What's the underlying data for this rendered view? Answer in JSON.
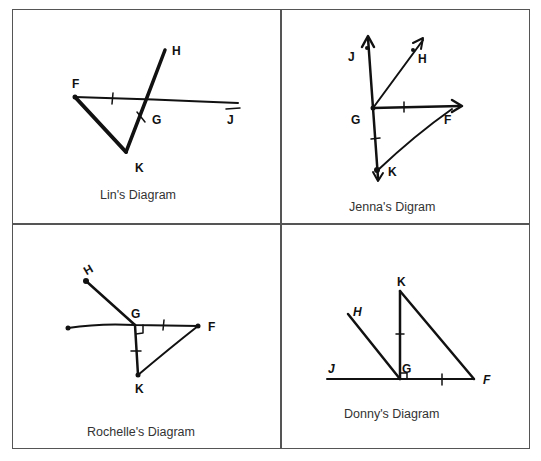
{
  "layout": {
    "rows": 2,
    "columns": 2,
    "border_color": "#555555",
    "ink_color": "#111111"
  },
  "panels": [
    {
      "caption": "Lin's Diagram",
      "labels": {
        "F": "F",
        "H": "H",
        "G": "G",
        "J": "J",
        "K": "K"
      },
      "description": "Segment FJ horizontal; line HK crosses FJ at G; segment FK; tick mark on FG and on GK"
    },
    {
      "caption": "Jenna's Digram",
      "labels": {
        "J": "J",
        "H": "H",
        "G": "G",
        "F": "F",
        "K": "K"
      },
      "description": "Rays from G toward J (up), H (up-right), F (right); ray G to K (down); segment FK; tick marks on GF and GK"
    },
    {
      "caption": "Rochelle's Diagram",
      "labels": {
        "H": "H",
        "G": "G",
        "F": "F",
        "K": "K"
      },
      "description": "Horizontal segment through G to F; segment GH; segment GK perpendicular (right-angle mark); segment FK; tick marks on GF and GK"
    },
    {
      "caption": "Donny's Diagram",
      "labels": {
        "K": "K",
        "H": "H",
        "J": "J",
        "G": "G",
        "F": "F"
      },
      "description": "Horizontal line J through G to F; vertical segment GK with right-angle mark; segment GH; segment KF; tick marks on GK and GF"
    }
  ]
}
